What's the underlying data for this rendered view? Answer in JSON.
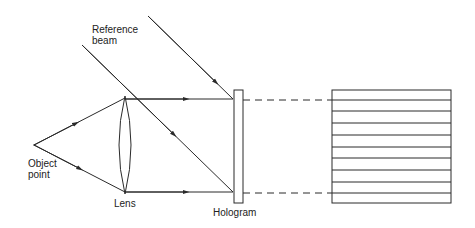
{
  "labels": {
    "reference_beam_line1": "Reference",
    "reference_beam_line2": "beam",
    "object_point_line1": "Object",
    "object_point_line2": "point",
    "lens": "Lens",
    "hologram": "Hologram"
  },
  "colors": {
    "stroke": "#2a2a2a",
    "background": "#ffffff"
  },
  "fringe_count": 10
}
